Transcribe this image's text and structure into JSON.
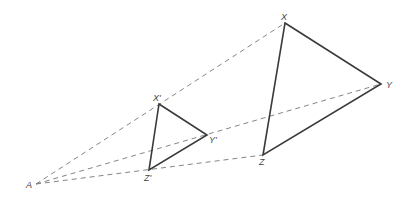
{
  "diagram": {
    "type": "dilation",
    "center": {
      "label": "A",
      "x": 36,
      "y": 184,
      "label_x": 26,
      "label_y": 188
    },
    "small_triangle": {
      "vertices": [
        {
          "label": "X'",
          "x": 159,
          "y": 104,
          "label_x": 153,
          "label_y": 101
        },
        {
          "label": "Y'",
          "x": 207,
          "y": 135,
          "label_x": 209,
          "label_y": 143
        },
        {
          "label": "Z'",
          "x": 149,
          "y": 170,
          "label_x": 144,
          "label_y": 181
        }
      ]
    },
    "large_triangle": {
      "vertices": [
        {
          "label": "X",
          "x": 285,
          "y": 23,
          "label_x": 281,
          "label_y": 20
        },
        {
          "label": "Y",
          "x": 381,
          "y": 84,
          "label_x": 386,
          "label_y": 88
        },
        {
          "label": "Z",
          "x": 263,
          "y": 155,
          "label_x": 259,
          "label_y": 165
        }
      ]
    },
    "rays": [
      "A→X",
      "A→Y",
      "A→Z"
    ]
  }
}
